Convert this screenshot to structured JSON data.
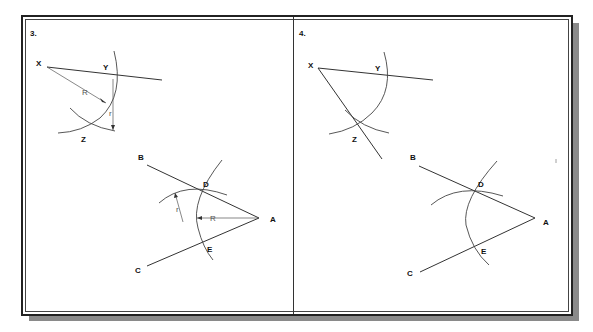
{
  "panels": [
    {
      "number": "3.",
      "labels": {
        "X": "X",
        "Y": "Y",
        "Z": "Z",
        "B": "B",
        "C": "C",
        "D": "D",
        "E": "E",
        "A": "A"
      },
      "dimensions": {
        "large_radius": "R",
        "small_radius": "r"
      }
    },
    {
      "number": "4.",
      "labels": {
        "X": "X",
        "Y": "Y",
        "Z": "Z",
        "B": "B",
        "C": "C",
        "D": "D",
        "E": "E",
        "A": "A"
      }
    }
  ],
  "colors": {
    "line": "#333333",
    "shadow": "#8a8a8a",
    "background": "#ffffff"
  }
}
